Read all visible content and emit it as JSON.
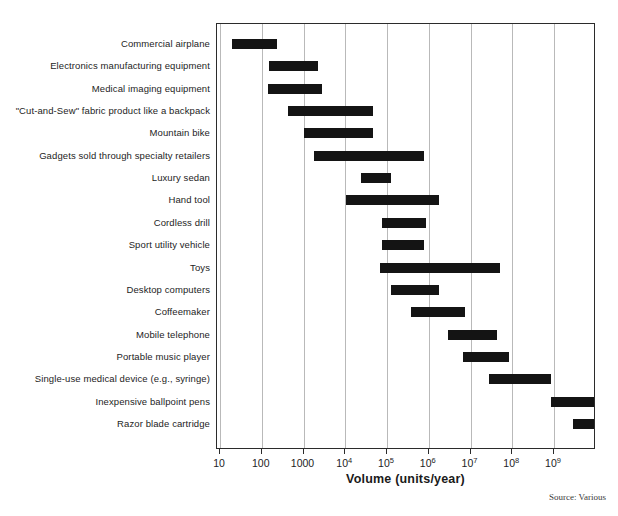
{
  "chart_data": {
    "type": "bar",
    "orientation": "horizontal",
    "subtype": "range-bar",
    "title": "",
    "xlabel": "Volume (units/year)",
    "ylabel": "",
    "xscale": "log",
    "xlim": [
      10,
      10000000000
    ],
    "grid": true,
    "legend": false,
    "source": "Source: Various",
    "xticks": [
      {
        "value": 10,
        "label": "10",
        "mantissa": "10",
        "exponent": ""
      },
      {
        "value": 100,
        "label": "100",
        "mantissa": "100",
        "exponent": ""
      },
      {
        "value": 1000,
        "label": "1000",
        "mantissa": "1000",
        "exponent": ""
      },
      {
        "value": 10000,
        "label": "10^4",
        "mantissa": "10",
        "exponent": "4"
      },
      {
        "value": 100000,
        "label": "10^5",
        "mantissa": "10",
        "exponent": "5"
      },
      {
        "value": 1000000,
        "label": "10^6",
        "mantissa": "10",
        "exponent": "6"
      },
      {
        "value": 10000000,
        "label": "10^7",
        "mantissa": "10",
        "exponent": "7"
      },
      {
        "value": 100000000,
        "label": "10^8",
        "mantissa": "10",
        "exponent": "8"
      },
      {
        "value": 1000000000,
        "label": "10^9",
        "mantissa": "10",
        "exponent": "9"
      }
    ],
    "categories": [
      "Commercial airplane",
      "Electronics manufacturing equipment",
      "Medical imaging equipment",
      "\"Cut-and-Sew\" fabric product like a backpack",
      "Mountain bike",
      "Gadgets sold through specialty retailers",
      "Luxury sedan",
      "Hand tool",
      "Cordless drill",
      "Sport utility vehicle",
      "Toys",
      "Desktop computers",
      "Coffeemaker",
      "Mobile telephone",
      "Portable music player",
      "Single-use medical device (e.g., syringe)",
      "Inexpensive ballpoint pens",
      "Razor blade cartridge"
    ],
    "ranges": [
      {
        "label": "Commercial airplane",
        "low": 20,
        "high": 250
      },
      {
        "label": "Electronics manufacturing equipment",
        "low": 160,
        "high": 2300
      },
      {
        "label": "Medical imaging equipment",
        "low": 150,
        "high": 3000
      },
      {
        "label": "\"Cut-and-Sew\" fabric product like a backpack",
        "low": 450,
        "high": 50000
      },
      {
        "label": "Mountain bike",
        "low": 1100,
        "high": 50000
      },
      {
        "label": "Gadgets sold through specialty retailers",
        "low": 1900,
        "high": 800000
      },
      {
        "label": "Luxury sedan",
        "low": 25000,
        "high": 130000
      },
      {
        "label": "Hand tool",
        "low": 11000,
        "high": 1900000
      },
      {
        "label": "Cordless drill",
        "low": 80000,
        "high": 900000
      },
      {
        "label": "Sport utility vehicle",
        "low": 80000,
        "high": 800000
      },
      {
        "label": "Toys",
        "low": 70000,
        "high": 55000000
      },
      {
        "label": "Desktop computers",
        "low": 130000,
        "high": 1900000
      },
      {
        "label": "Coffeemaker",
        "low": 400000,
        "high": 8000000
      },
      {
        "label": "Mobile telephone",
        "low": 3000000,
        "high": 45000000
      },
      {
        "label": "Portable music player",
        "low": 7000000,
        "high": 90000000
      },
      {
        "label": "Single-use medical device (e.g., syringe)",
        "low": 30000000,
        "high": 900000000
      },
      {
        "label": "Inexpensive ballpoint pens",
        "low": 900000000,
        "high": 10000000000
      },
      {
        "label": "Razor blade cartridge",
        "low": 3000000000,
        "high": 70000000000
      }
    ],
    "bar_color": "#141414",
    "grid_color": "#b9b9b9",
    "frame_color": "#2b2b2b"
  }
}
